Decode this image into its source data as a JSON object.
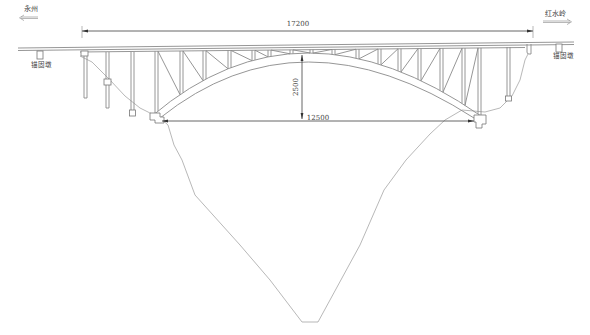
{
  "drawing": {
    "title": "Arch bridge elevation",
    "left_destination": "永州",
    "right_destination": "红水岭",
    "left_anchor_pier_label": "锚固墩",
    "right_anchor_pier_label": "锚固墩",
    "dimensions": {
      "overall_length": "17200",
      "arch_rise": "2500",
      "arch_span": "12500"
    },
    "colors": {
      "line": "#8a8a8a",
      "text": "#444444",
      "background": "#ffffff"
    }
  }
}
